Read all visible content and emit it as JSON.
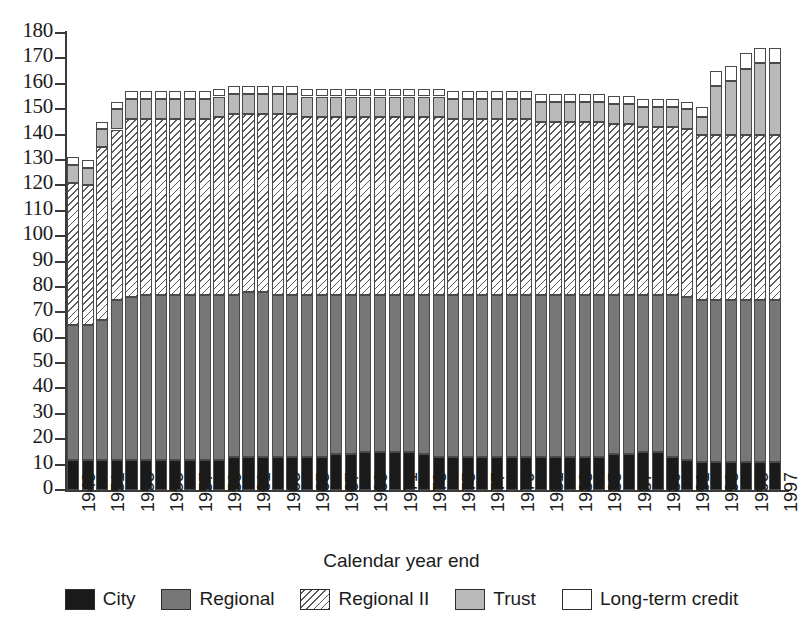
{
  "chart_data": {
    "type": "bar",
    "subtype": "stacked-bar",
    "title": "",
    "xlabel": "Calendar year end",
    "ylabel": "",
    "ylim": [
      0,
      180
    ],
    "ytick_step": 10,
    "yticks": [
      180,
      170,
      160,
      150,
      140,
      130,
      120,
      110,
      100,
      90,
      80,
      70,
      60,
      50,
      40,
      30,
      20,
      10,
      0
    ],
    "grid": false,
    "legend_position": "bottom",
    "x": [
      1949,
      1950,
      1951,
      1952,
      1953,
      1954,
      1955,
      1956,
      1957,
      1958,
      1959,
      1960,
      1961,
      1962,
      1963,
      1964,
      1965,
      1966,
      1967,
      1968,
      1969,
      1970,
      1971,
      1972,
      1973,
      1974,
      1975,
      1976,
      1977,
      1978,
      1979,
      1980,
      1981,
      1982,
      1983,
      1984,
      1985,
      1986,
      1987,
      1988,
      1989,
      1990,
      1991,
      1992,
      1993,
      1994,
      1995,
      1996,
      1997
    ],
    "xtick_labels": [
      "1949",
      "1951",
      "1953",
      "1955",
      "1957",
      "1959",
      "1961",
      "1963",
      "1965",
      "1967",
      "1969",
      "1971",
      "1973",
      "1975",
      "1977",
      "1979",
      "1981",
      "1983",
      "1985",
      "1987",
      "1989",
      "1991",
      "1993",
      "1995",
      "1997"
    ],
    "series": [
      {
        "name": "City",
        "color": "#1a1a1a",
        "pattern": "solid-black",
        "values": [
          12,
          12,
          12,
          12,
          12,
          12,
          12,
          12,
          12,
          12,
          12,
          13,
          13,
          13,
          13,
          13,
          13,
          13,
          14,
          14,
          15,
          15,
          15,
          15,
          14,
          13,
          13,
          13,
          13,
          13,
          13,
          13,
          13,
          13,
          13,
          13,
          13,
          14,
          14,
          15,
          15,
          13,
          12,
          11,
          11,
          11,
          11,
          11,
          11
        ]
      },
      {
        "name": "Regional",
        "color": "#777777",
        "pattern": "solid-gray",
        "values": [
          53,
          53,
          55,
          63,
          64,
          65,
          65,
          65,
          65,
          65,
          65,
          64,
          65,
          65,
          64,
          64,
          64,
          64,
          63,
          63,
          62,
          62,
          62,
          62,
          63,
          64,
          64,
          64,
          64,
          64,
          64,
          64,
          64,
          64,
          64,
          64,
          64,
          63,
          63,
          62,
          62,
          64,
          64,
          64,
          64,
          64,
          64,
          64,
          64
        ]
      },
      {
        "name": "Regional II",
        "color": "#ffffff",
        "pattern": "diagonal-hatch",
        "values": [
          56,
          55,
          68,
          67,
          70,
          69,
          69,
          69,
          69,
          69,
          70,
          71,
          70,
          70,
          71,
          71,
          70,
          70,
          70,
          70,
          70,
          70,
          70,
          70,
          70,
          70,
          69,
          69,
          69,
          69,
          69,
          69,
          68,
          68,
          68,
          68,
          68,
          67,
          67,
          66,
          66,
          66,
          66,
          65,
          65,
          65,
          65,
          65,
          65
        ]
      },
      {
        "name": "Trust",
        "color": "#b9b9b9",
        "pattern": "solid-light-gray",
        "values": [
          7,
          7,
          7,
          8,
          8,
          8,
          8,
          8,
          8,
          8,
          8,
          8,
          8,
          8,
          8,
          8,
          8,
          8,
          8,
          8,
          8,
          8,
          8,
          8,
          8,
          8,
          8,
          8,
          8,
          8,
          8,
          8,
          8,
          8,
          8,
          8,
          8,
          8,
          8,
          8,
          8,
          8,
          8,
          7,
          19,
          21,
          26,
          28,
          28
        ]
      },
      {
        "name": "Long-term credit",
        "color": "#ffffff",
        "pattern": "empty-white",
        "values": [
          3,
          3,
          3,
          3,
          3,
          3,
          3,
          3,
          3,
          3,
          3,
          3,
          3,
          3,
          3,
          3,
          3,
          3,
          3,
          3,
          3,
          3,
          3,
          3,
          3,
          3,
          3,
          3,
          3,
          3,
          3,
          3,
          3,
          3,
          3,
          3,
          3,
          3,
          3,
          3,
          3,
          3,
          3,
          4,
          6,
          6,
          6,
          6,
          6
        ]
      }
    ],
    "totals": [
      131,
      130,
      145,
      153,
      157,
      157,
      157,
      157,
      157,
      157,
      158,
      159,
      159,
      159,
      159,
      159,
      158,
      158,
      158,
      158,
      158,
      158,
      158,
      158,
      158,
      158,
      157,
      157,
      157,
      157,
      157,
      157,
      156,
      156,
      156,
      156,
      156,
      155,
      155,
      154,
      154,
      154,
      153,
      151,
      165,
      167,
      172,
      174,
      174
    ]
  },
  "axes": {
    "x_title": "Calendar year end"
  },
  "legend": {
    "items": [
      {
        "label": "City",
        "color": "#1a1a1a",
        "pattern": "solid-black"
      },
      {
        "label": "Regional",
        "color": "#777777",
        "pattern": "solid-gray"
      },
      {
        "label": "Regional II",
        "color": "#ffffff",
        "pattern": "diagonal-hatch"
      },
      {
        "label": "Trust",
        "color": "#b9b9b9",
        "pattern": "solid-light-gray"
      },
      {
        "label": "Long-term credit",
        "color": "#ffffff",
        "pattern": "empty-white"
      }
    ]
  }
}
